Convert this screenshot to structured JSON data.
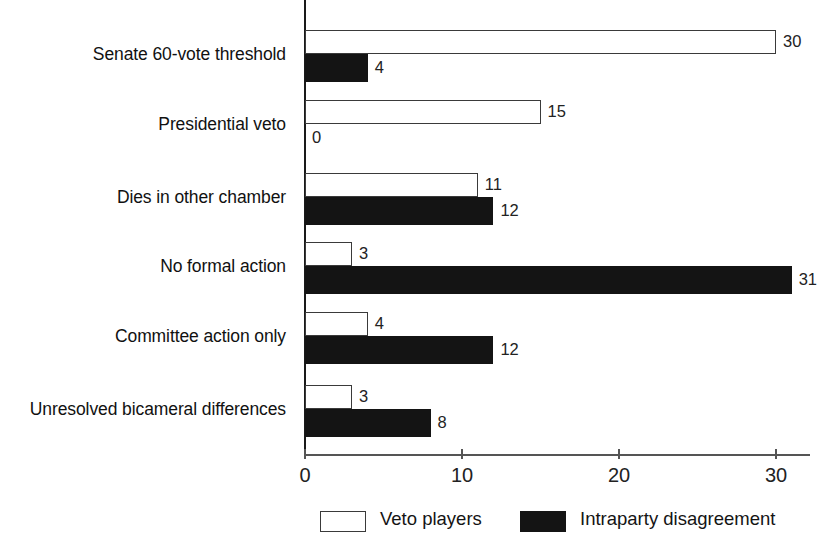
{
  "chart_data": {
    "type": "bar",
    "orientation": "horizontal",
    "title": "",
    "xlabel": "",
    "ylabel": "",
    "xlim": [
      0,
      32
    ],
    "grid": false,
    "legend_position": "bottom",
    "categories": [
      "Senate 60-vote threshold",
      "Presidential veto",
      "Dies in other chamber",
      "No formal action",
      "Committee action only",
      "Unresolved bicameral differences"
    ],
    "series": [
      {
        "name": "Veto players",
        "style": "open",
        "color": "#ffffff",
        "edge_color": "#3a3a3a",
        "values": [
          30,
          15,
          11,
          3,
          4,
          3
        ]
      },
      {
        "name": "Intraparty disagreement",
        "style": "solid",
        "color": "#141414",
        "edge_color": "#141414",
        "values": [
          4,
          0,
          12,
          31,
          12,
          8
        ]
      }
    ],
    "xticks": [
      0,
      10,
      20,
      30
    ],
    "xtick_labels": [
      "0",
      "10",
      "20",
      "30"
    ],
    "value_labels": {
      "Veto players": [
        "30",
        "15",
        "11",
        "3",
        "4",
        "3"
      ],
      "Intraparty disagreement": [
        "4",
        "0",
        "12",
        "31",
        "12",
        "8"
      ]
    }
  },
  "axis": {
    "ticks": [
      {
        "value": 0,
        "label": "0"
      },
      {
        "value": 10,
        "label": "10"
      },
      {
        "value": 20,
        "label": "20"
      },
      {
        "value": 30,
        "label": "30"
      }
    ]
  },
  "legend": {
    "items": [
      {
        "label": "Veto players",
        "style": "open"
      },
      {
        "label": "Intraparty disagreement",
        "style": "solid"
      }
    ]
  }
}
